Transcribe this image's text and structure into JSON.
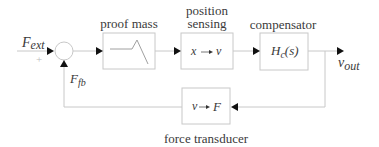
{
  "diagram": {
    "type": "feedback control block diagram",
    "inputs": {
      "external_force": {
        "symbol": "F",
        "subscript": "ext"
      },
      "plus_sign": "+",
      "feedback_force": {
        "symbol": "F",
        "subscript": "fb"
      }
    },
    "blocks": [
      {
        "id": "proof-mass",
        "title": "proof mass",
        "content": "frequency-response sketch"
      },
      {
        "id": "position-sensing",
        "title_line1": "position",
        "title_line2": "sensing",
        "from": "x",
        "to": "v"
      },
      {
        "id": "compensator",
        "title": "compensator",
        "transfer_symbol": "H",
        "transfer_subscript": "c",
        "transfer_arg": "(s)"
      },
      {
        "id": "force-transducer",
        "title": "force transducer",
        "from": "v",
        "to": "F"
      }
    ],
    "output": {
      "symbol": "v",
      "subscript": "out"
    },
    "colors": {
      "line": "#c8c8c8",
      "box": "#c8c8c8",
      "arrow": "#111111",
      "text": "#3a3a3a"
    }
  }
}
